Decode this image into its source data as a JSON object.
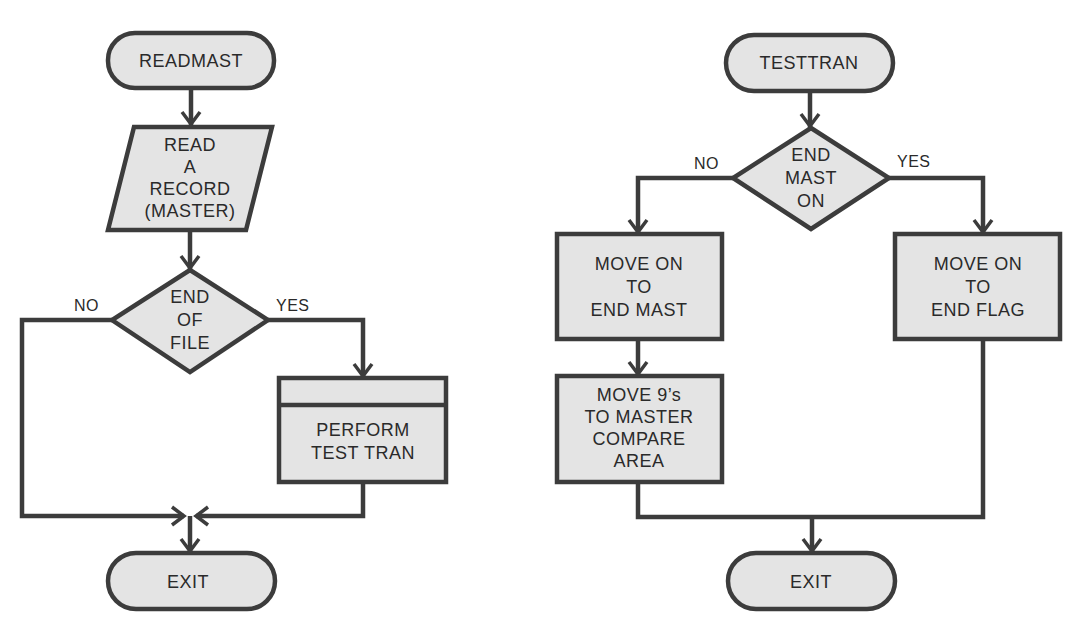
{
  "left_flowchart": {
    "start": "READMAST",
    "input": [
      "READ",
      "A",
      "RECORD",
      "(MASTER)"
    ],
    "decision": [
      "END",
      "OF",
      "FILE"
    ],
    "no_label": "NO",
    "yes_label": "YES",
    "process": [
      "PERFORM",
      "TEST TRAN"
    ],
    "end": "EXIT"
  },
  "right_flowchart": {
    "start": "TESTTRAN",
    "decision": [
      "END",
      "MAST",
      "ON"
    ],
    "no_label": "NO",
    "yes_label": "YES",
    "process_no": [
      "MOVE ON",
      "TO",
      "END MAST"
    ],
    "process_no_2": [
      "MOVE 9’s",
      "TO MASTER",
      "COMPARE",
      "AREA"
    ],
    "process_yes": [
      "MOVE ON",
      "TO",
      "END FLAG"
    ],
    "end": "EXIT"
  },
  "colors": {
    "fill": "#e4e4e4",
    "stroke": "#3c3c3c",
    "text": "#2a2a2a"
  }
}
